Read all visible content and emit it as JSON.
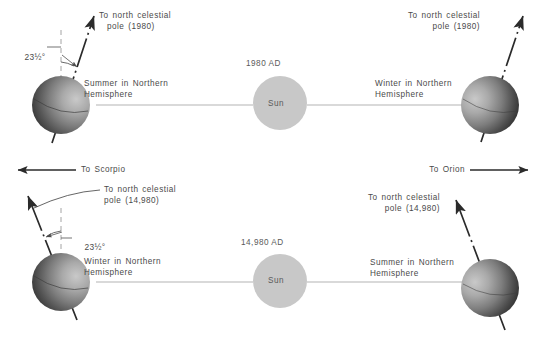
{
  "figure": {
    "type": "diagram",
    "background_color": "#ffffff",
    "line_color": "#2b2b2b",
    "orbit_line_color": "#b4b4b4",
    "text_color": "#4a4a4a",
    "sun_color": "#c8c8c8"
  },
  "rows": [
    {
      "id": "row-1980",
      "epoch_label": "1980 AD",
      "sun_label": "Sun",
      "left_planet": {
        "axis_label_line1": "To north celestial",
        "axis_label_line2": "pole (1980)",
        "season_line1": "Summer in Northern",
        "season_line2": "Hemisphere",
        "tilt_angle": "23½°",
        "tilt_degrees": 23.5,
        "lit_side": "right"
      },
      "right_planet": {
        "axis_label_line1": "To north celestial",
        "axis_label_line2": "pole (1980)",
        "season_line1": "Winter in Northern",
        "season_line2": "Hemisphere",
        "lit_side": "left"
      }
    },
    {
      "id": "row-14980",
      "epoch_label": "14,980 AD",
      "sun_label": "Sun",
      "left_planet": {
        "axis_label_line1": "To north celestial",
        "axis_label_line2": "pole (14,980)",
        "season_line1": "Winter in Northern",
        "season_line2": "Hemisphere",
        "tilt_angle": "23½°",
        "tilt_degrees": 23.5,
        "lit_side": "right"
      },
      "right_planet": {
        "axis_label_line1": "To north celestial",
        "axis_label_line2": "pole (14,980)",
        "season_line1": "Summer in Northern",
        "season_line2": "Hemisphere",
        "lit_side": "left"
      }
    }
  ],
  "direction_arrows": [
    {
      "id": "to-scorpio",
      "label": "To Scorpio",
      "direction": "left"
    },
    {
      "id": "to-orion",
      "label": "To Orion",
      "direction": "right"
    }
  ]
}
